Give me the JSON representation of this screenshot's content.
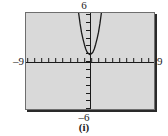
{
  "figure": {
    "caption": "(i)",
    "axis_labels": {
      "x_min": "–9",
      "x_max": "9",
      "y_min": "–6",
      "y_max": "6"
    },
    "colors": {
      "screen_background": "#d9d9d9",
      "frame_border": "#6e6e6e",
      "frame_shadow": "#2a2a2a",
      "axis": "#1a1a1a",
      "curve": "#1a1a1a",
      "page_background": "#ffffff"
    }
  },
  "chart_data": {
    "type": "line",
    "title": "",
    "subtitle": "",
    "xlabel": "",
    "ylabel": "",
    "xlim": [
      -9,
      9
    ],
    "ylim": [
      -6,
      6
    ],
    "grid": false,
    "legend": null,
    "annotations": [
      "(i)"
    ],
    "xticks": [
      -9,
      -8,
      -7,
      -6,
      -5,
      -4,
      -3,
      -2,
      -1,
      0,
      1,
      2,
      3,
      4,
      5,
      6,
      7,
      8,
      9
    ],
    "yticks": [
      -6,
      -5,
      -4,
      -3,
      -2,
      -1,
      0,
      1,
      2,
      3,
      4,
      5,
      6
    ],
    "tick_labels_shown": false,
    "series": [
      {
        "name": "parabola",
        "description": "narrow upward-opening parabola with vertex just above the origin",
        "vertex": [
          0,
          0.8
        ],
        "x": [
          -1.6,
          -1.4,
          -1.2,
          -1.0,
          -0.8,
          -0.6,
          -0.4,
          -0.2,
          0.0,
          0.2,
          0.4,
          0.6,
          0.8,
          1.0,
          1.2,
          1.4,
          1.6
        ],
        "y": [
          6.0,
          4.7,
          3.6,
          2.8,
          2.1,
          1.5,
          1.1,
          0.9,
          0.8,
          0.9,
          1.1,
          1.5,
          2.1,
          2.8,
          3.6,
          4.7,
          6.0
        ]
      }
    ]
  }
}
